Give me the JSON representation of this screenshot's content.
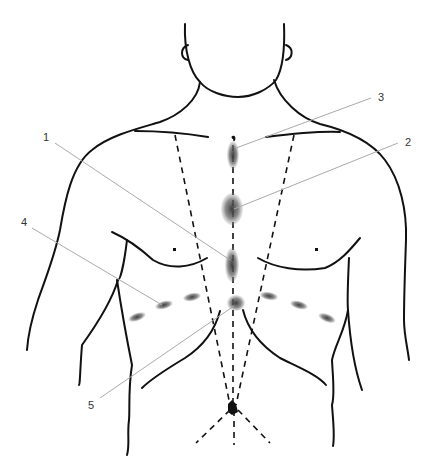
{
  "figure": {
    "colors": {
      "outline": "#111111",
      "leader": "#aaaaaa",
      "spot": "#555555",
      "label": "#333333"
    },
    "labels": [
      {
        "id": "1",
        "text": "1",
        "x": 43,
        "y": 141
      },
      {
        "id": "2",
        "text": "2",
        "x": 406,
        "y": 146
      },
      {
        "id": "3",
        "text": "3",
        "x": 379,
        "y": 101
      },
      {
        "id": "4",
        "text": "4",
        "x": 22,
        "y": 226
      },
      {
        "id": "5",
        "text": "5",
        "x": 91,
        "y": 408
      }
    ],
    "markers": [
      {
        "label": "3",
        "name": "upper-sternum-spot",
        "cx": 233,
        "cy": 155,
        "rx": 6,
        "ry": 14
      },
      {
        "label": "2",
        "name": "mid-sternum-spot",
        "cx": 232,
        "cy": 209,
        "rx": 11,
        "ry": 16
      },
      {
        "label": "1",
        "name": "lower-sternum-spot",
        "cx": 232,
        "cy": 265,
        "rx": 7,
        "ry": 17
      },
      {
        "label": "5",
        "name": "xiphoid-spot",
        "cx": 236,
        "cy": 303,
        "rx": 9,
        "ry": 8
      },
      {
        "label": "4",
        "name": "left-costal-spots",
        "points": [
          [
            192,
            297
          ],
          [
            164,
            305
          ],
          [
            137,
            317
          ]
        ]
      },
      {
        "label": "4",
        "name": "right-costal-spots",
        "points": [
          [
            269,
            296
          ],
          [
            299,
            305
          ],
          [
            327,
            318
          ]
        ]
      }
    ]
  }
}
